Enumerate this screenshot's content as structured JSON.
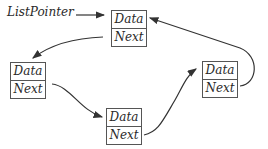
{
  "pointer_label": "ListPointer",
  "nodes": [
    {
      "data": "Data",
      "next": "Next"
    },
    {
      "data": "Data",
      "next": "Next"
    },
    {
      "data": "Data",
      "next": "Next"
    },
    {
      "data": "Data",
      "next": "Next"
    }
  ],
  "colors": {
    "line": "#333333",
    "box": "#555555"
  }
}
